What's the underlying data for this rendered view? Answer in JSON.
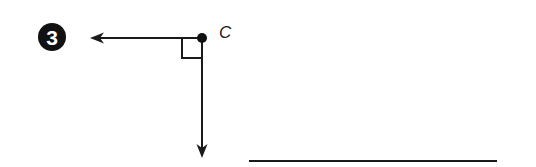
{
  "problem": {
    "number": "3",
    "badge_color": "#111111"
  },
  "diagram": {
    "point_label": "C",
    "vertex": {
      "x": 202,
      "y": 38
    },
    "ray_left_end": {
      "x": 90,
      "y": 38
    },
    "ray_down_end": {
      "x": 202,
      "y": 158
    },
    "right_angle_marker": true,
    "stroke_color": "#1a1a1a"
  },
  "answer_line": {
    "x1": 249,
    "x2": 497,
    "y": 161,
    "value": ""
  }
}
